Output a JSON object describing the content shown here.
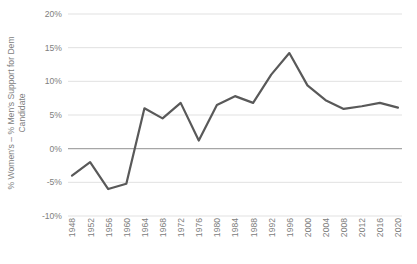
{
  "chart_data": {
    "type": "line",
    "title": "",
    "xlabel": "",
    "ylabel": "% Women's – % Men's Support for Dem Candidate",
    "ylabel_line1": "% Women's – % Men's Support for Dem",
    "ylabel_line2": "Candidate",
    "categories": [
      "1948",
      "1952",
      "1956",
      "1960",
      "1964",
      "1968",
      "1972",
      "1976",
      "1980",
      "1984",
      "1988",
      "1992",
      "1996",
      "2000",
      "2004",
      "2008",
      "2012",
      "2016",
      "2020"
    ],
    "values": [
      -4.0,
      -2.0,
      -6.0,
      -5.2,
      6.0,
      4.5,
      6.8,
      1.2,
      6.5,
      7.8,
      6.8,
      11.0,
      14.2,
      9.4,
      7.2,
      5.9,
      6.3,
      6.8,
      6.1
    ],
    "ytick_labels": [
      "20%",
      "15%",
      "10%",
      "5%",
      "0%",
      "-5%",
      "-10%"
    ],
    "ytick_values": [
      20,
      15,
      10,
      5,
      0,
      -5,
      -10
    ],
    "ylim": [
      -10,
      20
    ],
    "ytick_step": 5,
    "grid": true,
    "gridlines_horizontal": true,
    "gridlines_vertical": false,
    "legend": "none",
    "legend_position": "none",
    "series": [
      {
        "name": "Gender gap",
        "values": [
          -4.0,
          -2.0,
          -6.0,
          -5.2,
          6.0,
          4.5,
          6.8,
          1.2,
          6.5,
          7.8,
          6.8,
          11.0,
          14.2,
          9.4,
          7.2,
          5.9,
          6.3,
          6.8,
          6.1
        ]
      }
    ],
    "colors": {
      "line": "#595959",
      "grid": "#d9d9d9",
      "zero_line": "#a6a6a6",
      "tick_text": "#808080",
      "background": "#ffffff"
    },
    "line_width": 2.2,
    "markers": "none"
  }
}
